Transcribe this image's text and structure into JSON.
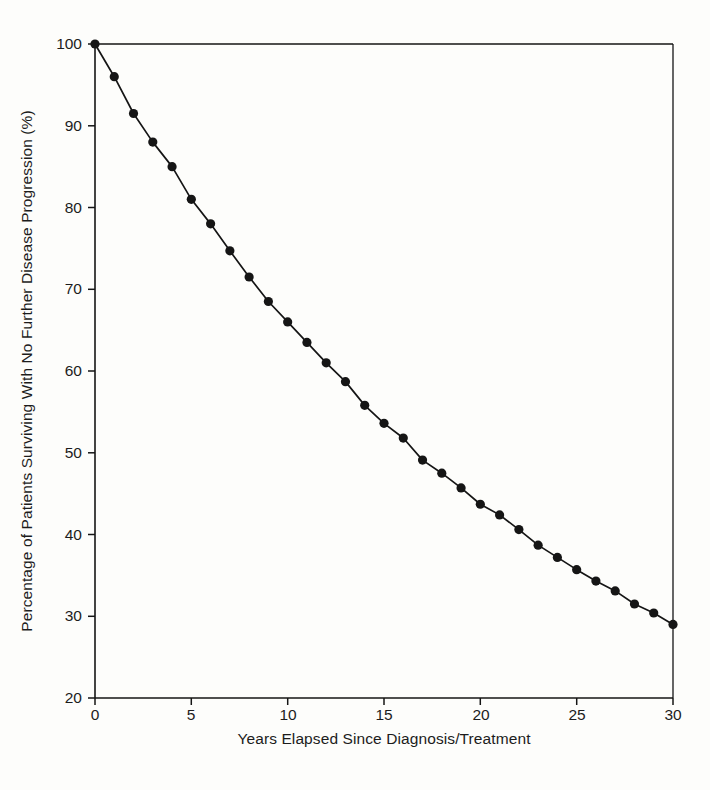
{
  "figure": {
    "background_color": "#fdfdfb",
    "ink_color": "#151515"
  },
  "axis": {
    "x_label": "Years Elapsed Since Diagnosis/Treatment",
    "y_label": "Percentage of Patients Surviving With No Further Disease Progression (%)",
    "x_ticks": [
      "0",
      "5",
      "10",
      "15",
      "20",
      "25",
      "30"
    ],
    "y_ticks": [
      "20",
      "30",
      "40",
      "50",
      "60",
      "70",
      "80",
      "90",
      "100"
    ]
  },
  "chart_data": {
    "type": "line",
    "title": "",
    "xlabel": "Years Elapsed Since Diagnosis/Treatment",
    "ylabel": "Percentage of Patients Surviving With No Further Disease Progression (%)",
    "xlim": [
      0,
      30
    ],
    "ylim": [
      20,
      100
    ],
    "xticks": [
      0,
      5,
      10,
      15,
      20,
      25,
      30
    ],
    "yticks": [
      20,
      30,
      40,
      50,
      60,
      70,
      80,
      90,
      100
    ],
    "grid": false,
    "legend": null,
    "marker": "filled-circle",
    "series": [
      {
        "name": "Progression-free survival",
        "x": [
          0,
          1,
          2,
          3,
          4,
          5,
          6,
          7,
          8,
          9,
          10,
          11,
          12,
          13,
          14,
          15,
          16,
          17,
          18,
          19,
          20,
          21,
          22,
          23,
          24,
          25,
          26,
          27,
          28,
          29,
          30
        ],
        "values": [
          100,
          96,
          91.5,
          88,
          85,
          81,
          78,
          74.7,
          71.5,
          68.5,
          66,
          63.5,
          61,
          58.7,
          55.8,
          53.6,
          51.8,
          49.1,
          47.5,
          45.7,
          43.7,
          42.4,
          40.6,
          38.7,
          37.2,
          35.7,
          34.3,
          33.1,
          31.5,
          30.4,
          29
        ]
      }
    ]
  }
}
